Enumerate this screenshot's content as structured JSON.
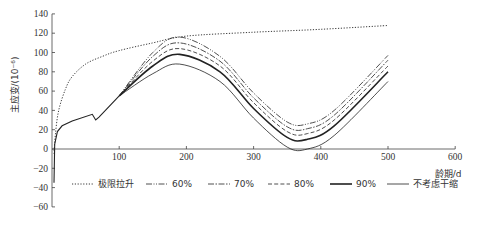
{
  "chart_data": {
    "type": "line",
    "title": "",
    "xlabel": "龄期/d",
    "ylabel": "主应变/(10⁻⁶)",
    "xlim": [
      0,
      600
    ],
    "ylim": [
      -60,
      140
    ],
    "xticks": [
      100,
      200,
      300,
      400,
      500,
      600
    ],
    "yticks": [
      140,
      120,
      100,
      80,
      60,
      40,
      20,
      0,
      -20,
      -40,
      -60
    ],
    "grid": false,
    "legend_position": "bottom",
    "series": [
      {
        "name": "极限拉升",
        "style": "dotted",
        "x": [
          3,
          5,
          10,
          20,
          30,
          50,
          75,
          100,
          150,
          200,
          300,
          400,
          500
        ],
        "y": [
          -5,
          15,
          40,
          62,
          75,
          88,
          96,
          102,
          110,
          117,
          121,
          124,
          128
        ]
      },
      {
        "name": "60%",
        "style": "dash-dot-dot",
        "x": [
          100,
          150,
          190,
          250,
          300,
          350,
          380,
          420,
          500
        ],
        "y": [
          55,
          100,
          116,
          96,
          58,
          28,
          26,
          40,
          97
        ]
      },
      {
        "name": "70%",
        "style": "dash-dot",
        "x": [
          100,
          150,
          190,
          250,
          300,
          350,
          380,
          420,
          500
        ],
        "y": [
          55,
          96,
          110,
          91,
          53,
          23,
          21,
          35,
          92
        ]
      },
      {
        "name": "80%",
        "style": "dashed",
        "x": [
          100,
          150,
          190,
          250,
          300,
          350,
          380,
          420,
          500
        ],
        "y": [
          55,
          91,
          104,
          86,
          48,
          18,
          16,
          30,
          86
        ]
      },
      {
        "name": "90%",
        "style": "solid-thick",
        "x": [
          100,
          150,
          190,
          250,
          300,
          350,
          380,
          420,
          500
        ],
        "y": [
          55,
          86,
          98,
          80,
          42,
          12,
          10,
          24,
          80
        ]
      },
      {
        "name": "不考虑干缩",
        "style": "solid-thin",
        "x": [
          100,
          150,
          190,
          250,
          300,
          350,
          380,
          420,
          500
        ],
        "y": [
          55,
          78,
          88,
          70,
          32,
          2,
          0,
          14,
          70
        ]
      }
    ],
    "common_early_curve": {
      "x": [
        3,
        4,
        8,
        15,
        30,
        60,
        65,
        70,
        100
      ],
      "y": [
        -35,
        5,
        18,
        24,
        29,
        36,
        30,
        33,
        55
      ]
    }
  },
  "legend": {
    "items": [
      "极限拉升",
      "60%",
      "70%",
      "80%",
      "90%",
      "不考虑干缩"
    ]
  },
  "axes": {
    "x_label": "龄期/d",
    "y_label": "主应变/(10⁻⁶)"
  }
}
